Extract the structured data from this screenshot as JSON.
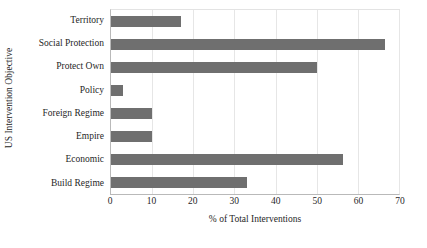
{
  "chart_data": {
    "type": "bar",
    "orientation": "horizontal",
    "title": "",
    "xlabel": "% of Total Interventions",
    "ylabel": "US Intervention Objective",
    "categories": [
      "Territory",
      "Social Protection",
      "Protect Own",
      "Policy",
      "Foreign Regime",
      "Empire",
      "Economic",
      "Build Regime"
    ],
    "values": [
      17,
      66.5,
      50,
      3,
      10,
      10,
      56.5,
      33
    ],
    "xlim": [
      0,
      70
    ],
    "ylim": null,
    "xticks": [
      0,
      10,
      20,
      30,
      40,
      50,
      60,
      70
    ],
    "xtick_labels": [
      "0",
      "10",
      "20",
      "30",
      "40",
      "50",
      "60",
      "70"
    ],
    "grid": "vertical",
    "legend": "none",
    "bar_color": "#6f6f6f",
    "gridline_color": "#e6e6e6",
    "axis_color": "#b9b9b9",
    "background_color": "#ffffff"
  }
}
